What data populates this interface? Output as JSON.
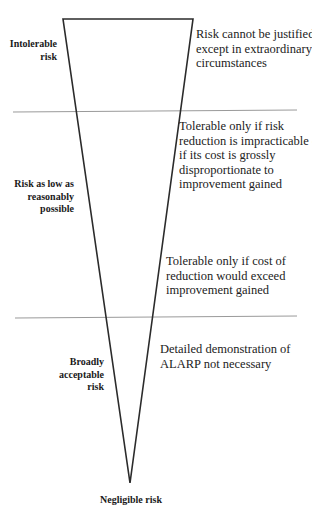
{
  "diagram": {
    "type": "ALARP risk triangle",
    "colors": {
      "triangle_stroke": "#2b2b2b",
      "divider": "#9a9a9a",
      "text": "#222222",
      "background": "#ffffff"
    },
    "zones": [
      {
        "label_lines": [
          "Intolerable",
          "risk"
        ],
        "descriptions": [
          {
            "lines": [
              "Risk cannot be justified",
              "except in extraordinary",
              "circumstances"
            ]
          }
        ]
      },
      {
        "label_lines": [
          "Risk as low as",
          "reasonably",
          "possible"
        ],
        "descriptions": [
          {
            "lines": [
              "Tolerable only if risk",
              "reduction is impracticable or",
              "if its cost is grossly",
              "disproportionate to",
              "improvement gained"
            ]
          },
          {
            "lines": [
              "Tolerable only if cost of",
              "reduction would exceed",
              "improvement gained"
            ]
          }
        ]
      },
      {
        "label_lines": [
          "Broadly",
          "acceptable",
          "risk"
        ],
        "descriptions": [
          {
            "lines": [
              "Detailed demonstration of",
              "ALARP not necessary"
            ]
          }
        ]
      }
    ],
    "apex_label": "Negligible risk"
  }
}
